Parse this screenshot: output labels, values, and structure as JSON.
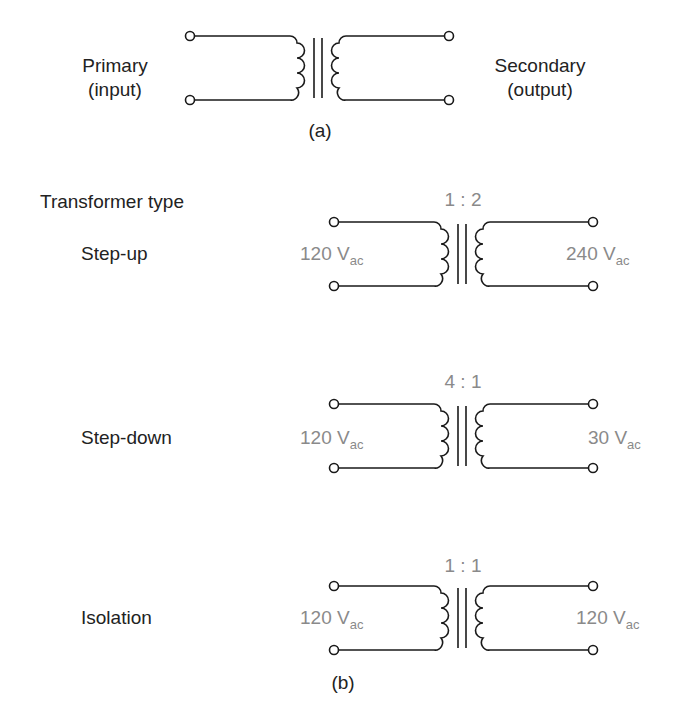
{
  "figure_a": {
    "primary_label_line1": "Primary",
    "primary_label_line2": "(input)",
    "secondary_label_line1": "Secondary",
    "secondary_label_line2": "(output)",
    "caption": "(a)"
  },
  "figure_b": {
    "heading": "Transformer type",
    "caption": "(b)",
    "transformers": [
      {
        "type": "Step-up",
        "ratio": "1 : 2",
        "input_value": "120 V",
        "input_sub": "ac",
        "output_value": "240 V",
        "output_sub": "ac"
      },
      {
        "type": "Step-down",
        "ratio": "4 : 1",
        "input_value": "120 V",
        "input_sub": "ac",
        "output_value": "30 V",
        "output_sub": "ac"
      },
      {
        "type": "Isolation",
        "ratio": "1 : 1",
        "input_value": "120 V",
        "input_sub": "ac",
        "output_value": "120 V",
        "output_sub": "ac"
      }
    ]
  },
  "colors": {
    "line": "#1a1a1a",
    "label": "#222222",
    "value_grey": "#8a8a8a"
  }
}
